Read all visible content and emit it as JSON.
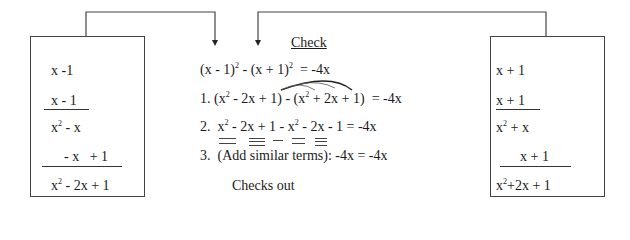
{
  "left_box": {
    "line1": "x -1",
    "line2": "x - 1",
    "line3_base": "x",
    "line3_exp": "2",
    "line3_rest": " - x",
    "line4": "- x   + 1",
    "line5_base": "x",
    "line5_exp": "2",
    "line5_rest": " - 2x + 1"
  },
  "right_box": {
    "line1": "x + 1",
    "line2": "x + 1",
    "line3_base": "x",
    "line3_exp": "2",
    "line3_rest": " + x",
    "line4": "x + 1",
    "line5_base": "x",
    "line5_exp": "2",
    "line5_rest": "+2x + 1"
  },
  "check": {
    "title": "Check",
    "equation": {
      "a": "(x - 1)",
      "a_exp": "2",
      "b": " - (x + 1)",
      "b_exp": "2",
      "c": "  = -4x"
    },
    "step1": {
      "num": "1.",
      "a": "(x",
      "a_exp": "2",
      "b": " - 2x + 1) - (x",
      "b_exp": "2",
      "c": " + 2x + 1)  = -4x"
    },
    "step2": {
      "num": "2.",
      "a": "x",
      "a_exp": "2",
      "b": " - 2x + 1 - x",
      "b_exp": "2",
      "c": " - 2x - 1 = -4x"
    },
    "step3": {
      "num": "3.",
      "text": "(Add similar terms): -4x = -4x"
    },
    "conclusion": "Checks out"
  }
}
